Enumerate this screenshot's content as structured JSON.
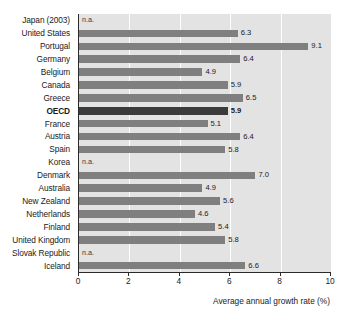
{
  "chart_data": {
    "type": "bar",
    "orientation": "horizontal",
    "title": "",
    "subtitle": "",
    "xlabel": "Average annual growth rate (%)",
    "ylabel": "",
    "xlim": [
      0,
      10
    ],
    "xticks": [
      0,
      2,
      4,
      6,
      8,
      10
    ],
    "xtick_labels": [
      "0",
      "2",
      "4",
      "6",
      "8",
      "10"
    ],
    "grid": true,
    "grid_axis": "x",
    "legend": false,
    "legend_position": "none",
    "highlight_category": "OECD",
    "missing_label": "n.a.",
    "categories": [
      "Japan (2003)",
      "United States",
      "Portugal",
      "Germany",
      "Belgium",
      "Canada",
      "Greece",
      "OECD",
      "France",
      "Austria",
      "Spain",
      "Korea",
      "Denmark",
      "Australia",
      "New Zealand",
      "Netherlands",
      "Finland",
      "United Kingdom",
      "Slovak Republic",
      "Iceland"
    ],
    "values": [
      null,
      6.3,
      9.1,
      6.4,
      4.9,
      5.9,
      6.5,
      5.9,
      5.1,
      6.4,
      5.8,
      null,
      7.0,
      4.9,
      5.6,
      4.6,
      5.4,
      5.8,
      null,
      6.6
    ],
    "value_labels": [
      "n.a.",
      "6.3",
      "9.1",
      "6.4",
      "4.9",
      "5.9",
      "6.5",
      "5.9",
      "5.1",
      "6.4",
      "5.8",
      "n.a.",
      "7.0",
      "4.9",
      "5.6",
      "4.6",
      "5.4",
      "5.8",
      "n.a.",
      "6.6"
    ],
    "colors": {
      "bar": "#7f7f7f",
      "bar_highlight": "#3b3b3b",
      "plot_background": "#e3e3e3",
      "gridline": "#ffffff",
      "axis": "#2a2a2a",
      "text": "#1a1a1a"
    }
  }
}
